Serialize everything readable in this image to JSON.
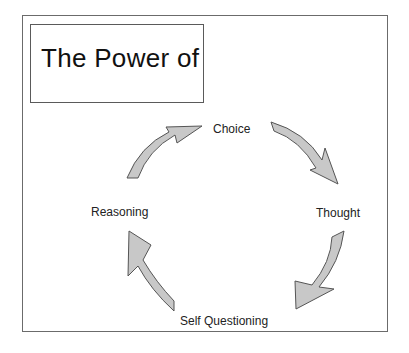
{
  "title": "The Power of",
  "cycle": {
    "nodes": [
      {
        "label": "Choice"
      },
      {
        "label": "Thought"
      },
      {
        "label": "Self Questioning"
      },
      {
        "label": "Reasoning"
      }
    ],
    "arrow_fill": "#c8c8c8",
    "arrow_stroke": "#555555"
  }
}
